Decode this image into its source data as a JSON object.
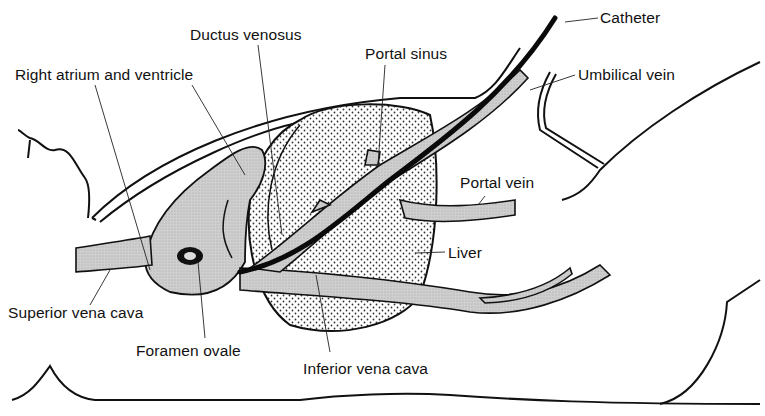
{
  "diagram": {
    "type": "anatomical-illustration",
    "colors": {
      "ink": "#111111",
      "vessel_fill": "#c8c8c8",
      "liver_fill": "#ffffff",
      "liver_dots": "#333333",
      "catheter": "#0a0a0a"
    }
  },
  "labels": {
    "catheter": "Catheter",
    "umbilical_vein": "Umbilical vein",
    "ductus_venosus": "Ductus venosus",
    "portal_sinus": "Portal sinus",
    "right_atrium_ventricle": "Right atrium and ventricle",
    "portal_vein": "Portal vein",
    "liver": "Liver",
    "superior_vena_cava": "Superior vena cava",
    "foramen_ovale": "Foramen ovale",
    "inferior_vena_cava": "Inferior vena cava"
  }
}
